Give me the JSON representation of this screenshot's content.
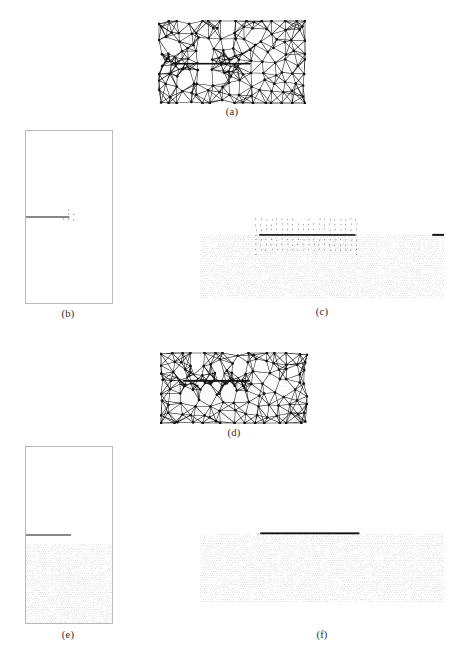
{
  "document": {
    "header_text": "",
    "figure_kind": "six-panel finite-element crack analysis figure",
    "background_color": "#ffffff",
    "ink_color": "#111111",
    "border_color": "#b9b9b9",
    "stipple_color": "#9a9a9a"
  },
  "panels": [
    {
      "id": "a",
      "caption": "(a)",
      "kind": "mesh",
      "x": 158,
      "y": 20,
      "w": 148,
      "h": 84,
      "caption_x": 158,
      "caption_y": 106,
      "caption_w": 148,
      "boxed": false,
      "mesh": {
        "seed": 1207,
        "cols": 15,
        "rows": 9,
        "jitter": 0.4,
        "node_radius": 1.35,
        "edge_width": 0.55,
        "crack_y_frac": 0.52,
        "crack_x0_frac": 0.1,
        "crack_x1_frac": 0.62,
        "crack_width": 1.7,
        "refine_mode": "tips",
        "refine_points": [
          [
            0.13,
            0.52
          ],
          [
            0.47,
            0.52
          ]
        ],
        "refine_count": 46,
        "refine_radius": 0.085,
        "refine_node_radius": 0.9,
        "lower_shade": false
      }
    },
    {
      "id": "b",
      "caption": "(b)",
      "kind": "vectorfield",
      "x": 25,
      "y": 130,
      "w": 86,
      "h": 172,
      "caption_x": 25,
      "caption_y": 308,
      "caption_w": 86,
      "boxed": true,
      "field": {
        "seed": 4421,
        "type": "radial-opening",
        "nx": 17,
        "ny": 34,
        "singularities": [
          {
            "x": 0.5,
            "y": 0.5,
            "strength": 1.0,
            "swirl": 0.0
          }
        ],
        "crack_line": {
          "y": 0.5,
          "x0": 0.0,
          "x1": 0.5,
          "width": 0.9
        },
        "scale": 0.95,
        "head": 0.34,
        "min_len": 0.8,
        "max_len": 13.0,
        "stipple_below": false,
        "stipple_y": 0.56
      }
    },
    {
      "id": "c",
      "caption": "(c)",
      "kind": "vectorfield",
      "x": 200,
      "y": 146,
      "w": 244,
      "h": 152,
      "caption_x": 200,
      "caption_y": 306,
      "caption_w": 244,
      "boxed": false,
      "field": {
        "seed": 9133,
        "type": "radial-opening",
        "nx": 46,
        "ny": 30,
        "singularities": [
          {
            "x": 0.245,
            "y": 0.585,
            "strength": 1.0,
            "swirl": 0.0
          },
          {
            "x": 0.635,
            "y": 0.585,
            "strength": 1.0,
            "swirl": 0.0
          }
        ],
        "crack_line": {
          "y": 0.585,
          "x0": 0.245,
          "x1": 0.635,
          "width": 1.6
        },
        "edge_tick": {
          "y": 0.585,
          "x0": 0.955,
          "x1": 1.0,
          "width": 2.0
        },
        "scale": 1.0,
        "head": 0.34,
        "min_len": 0.7,
        "max_len": 15.0,
        "stipple_below": true,
        "stipple_y": 0.585
      }
    },
    {
      "id": "d",
      "caption": "(d)",
      "kind": "mesh",
      "x": 160,
      "y": 352,
      "w": 148,
      "h": 72,
      "caption_x": 160,
      "caption_y": 427,
      "caption_w": 148,
      "boxed": false,
      "mesh": {
        "seed": 3381,
        "cols": 15,
        "rows": 8,
        "jitter": 0.4,
        "node_radius": 1.35,
        "edge_width": 0.55,
        "crack_y_frac": 0.4,
        "crack_x0_frac": 0.16,
        "crack_x1_frac": 0.6,
        "crack_width": 1.9,
        "refine_mode": "line",
        "refine_points": [
          [
            0.18,
            0.41
          ],
          [
            0.3,
            0.41
          ],
          [
            0.42,
            0.41
          ],
          [
            0.54,
            0.41
          ]
        ],
        "refine_count": 40,
        "refine_radius": 0.075,
        "refine_node_radius": 0.85,
        "lower_shade": true
      }
    },
    {
      "id": "e",
      "caption": "(e)",
      "kind": "vectorfield",
      "x": 25,
      "y": 446,
      "w": 86,
      "h": 176,
      "caption_x": 25,
      "caption_y": 629,
      "caption_w": 86,
      "boxed": true,
      "field": {
        "seed": 7712,
        "type": "vortex-shear",
        "nx": 18,
        "ny": 36,
        "singularities": [
          {
            "x": 0.5,
            "y": 0.5,
            "strength": 0.9,
            "swirl": 1.0
          }
        ],
        "crack_line": {
          "y": 0.5,
          "x0": 0.0,
          "x1": 0.52,
          "width": 0.9
        },
        "scale": 0.9,
        "head": 0.34,
        "min_len": 0.8,
        "max_len": 12.0,
        "stipple_below": true,
        "stipple_y": 0.555
      }
    },
    {
      "id": "f",
      "caption": "(f)",
      "kind": "vectorfield",
      "x": 200,
      "y": 450,
      "w": 244,
      "h": 152,
      "caption_x": 200,
      "caption_y": 629,
      "caption_w": 244,
      "boxed": false,
      "field": {
        "seed": 5507,
        "type": "vortex-shear",
        "nx": 44,
        "ny": 30,
        "singularities": [
          {
            "x": 0.235,
            "y": 0.555,
            "strength": 1.0,
            "swirl": 1.0
          },
          {
            "x": 0.645,
            "y": 0.545,
            "strength": 1.0,
            "swirl": -1.0
          }
        ],
        "crack_line": {
          "y": 0.548,
          "x0": 0.25,
          "x1": 0.65,
          "width": 1.9
        },
        "scale": 1.0,
        "head": 0.34,
        "min_len": 0.7,
        "max_len": 15.0,
        "stipple_below": true,
        "stipple_y": 0.555
      }
    }
  ]
}
